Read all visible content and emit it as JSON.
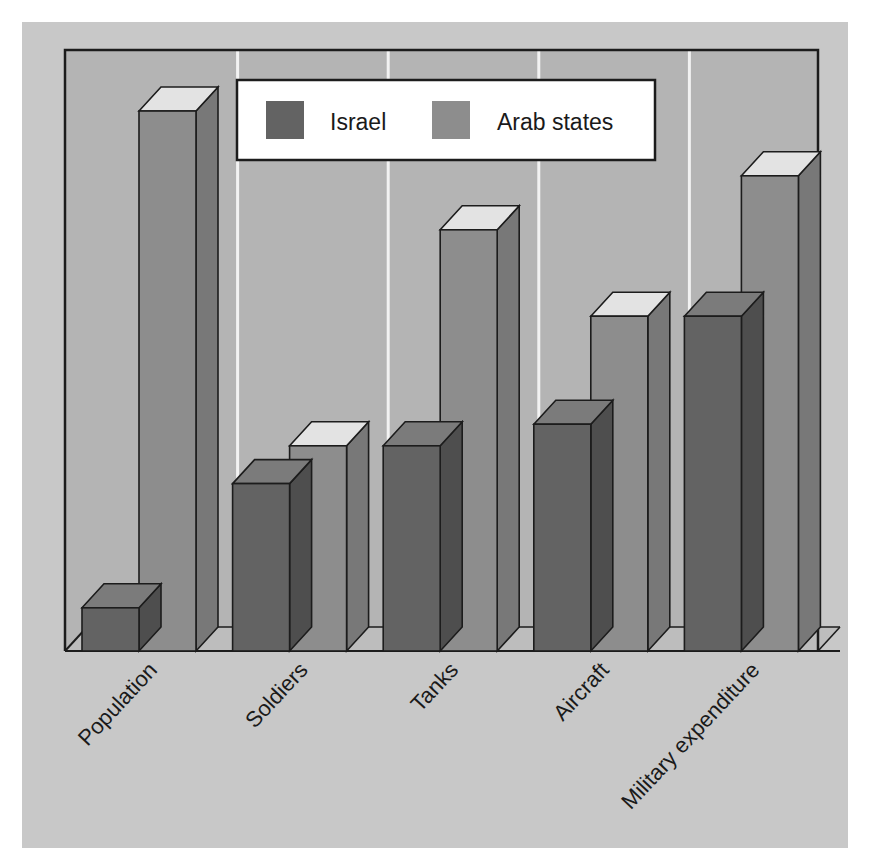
{
  "chart_data": {
    "type": "bar",
    "title": "",
    "subtitle": "",
    "xlabel": "",
    "ylabel": "",
    "style": "3d-grouped-column",
    "grid": "vertical-category-separators",
    "axis_tick_labels": [],
    "ylim": [
      0,
      100
    ],
    "legend_position": "top-center",
    "categories": [
      "Population",
      "Soldiers",
      "Tanks",
      "Aircraft",
      "Military expenditure"
    ],
    "series": [
      {
        "name": "Israel",
        "color": "#636363",
        "values": [
          8,
          31,
          38,
          42,
          62
        ]
      },
      {
        "name": "Arab states",
        "color": "#8d8d8d",
        "values": [
          100,
          38,
          78,
          62,
          88
        ]
      }
    ],
    "annotations": []
  },
  "legend": {
    "items": [
      {
        "label": "Israel",
        "swatch": "#636363"
      },
      {
        "label": "Arab states",
        "swatch": "#8d8d8d"
      }
    ]
  },
  "axis": {
    "categories": [
      "Population",
      "Soldiers",
      "Tanks",
      "Aircraft",
      "Military expenditure"
    ],
    "rotation_degrees": -47
  },
  "colors": {
    "page_background": "#ffffff",
    "chart_background": "#c8c8c8",
    "plot_background": "#b4b4b4",
    "floor": "#bdbdbd",
    "gridline": "#f2f2f2",
    "border": "#1c1c1c",
    "legend_background": "#ffffff",
    "israel_front": "#636363",
    "israel_side": "#4e4e4e",
    "israel_top": "#7b7b7b",
    "arab_front": "#8d8d8d",
    "arab_side": "#787878",
    "arab_top": "#e3e3e3"
  }
}
